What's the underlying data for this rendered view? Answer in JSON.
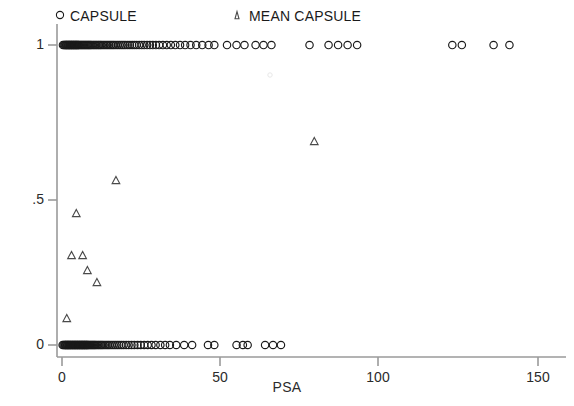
{
  "chart_data": {
    "type": "scatter",
    "title": "",
    "xlabel": "PSA",
    "ylabel": "",
    "xlim": [
      0,
      150
    ],
    "ylim": [
      0,
      1
    ],
    "xticks": [
      0,
      50,
      100,
      150
    ],
    "xtick_labels": [
      "0",
      "50",
      "100",
      "150"
    ],
    "yticks": [
      0,
      0.5,
      1
    ],
    "ytick_labels": [
      "0",
      ".5",
      "1"
    ],
    "grid": false,
    "legend_position": "top",
    "series": [
      {
        "name": "CAPSULE",
        "marker": "circle",
        "color": "#1a1a1a",
        "points": [
          [
            0.3,
            1
          ],
          [
            0.6,
            1
          ],
          [
            0.9,
            1
          ],
          [
            1.1,
            1
          ],
          [
            1.3,
            1
          ],
          [
            1.5,
            1
          ],
          [
            1.7,
            1
          ],
          [
            1.9,
            1
          ],
          [
            2.1,
            1
          ],
          [
            2.3,
            1
          ],
          [
            2.5,
            1
          ],
          [
            2.7,
            1
          ],
          [
            2.9,
            1
          ],
          [
            3.1,
            1
          ],
          [
            3.3,
            1
          ],
          [
            3.5,
            1
          ],
          [
            3.7,
            1
          ],
          [
            3.9,
            1
          ],
          [
            4.1,
            1
          ],
          [
            4.3,
            1
          ],
          [
            4.5,
            1
          ],
          [
            4.7,
            1
          ],
          [
            4.9,
            1
          ],
          [
            5.1,
            1
          ],
          [
            5.3,
            1
          ],
          [
            5.6,
            1
          ],
          [
            5.9,
            1
          ],
          [
            6.2,
            1
          ],
          [
            6.5,
            1
          ],
          [
            6.8,
            1
          ],
          [
            7.1,
            1
          ],
          [
            7.4,
            1
          ],
          [
            7.7,
            1
          ],
          [
            8.0,
            1
          ],
          [
            8.3,
            1
          ],
          [
            8.6,
            1
          ],
          [
            8.9,
            1
          ],
          [
            9.2,
            1
          ],
          [
            9.6,
            1
          ],
          [
            10.0,
            1
          ],
          [
            10.4,
            1
          ],
          [
            10.8,
            1
          ],
          [
            11.2,
            1
          ],
          [
            11.6,
            1
          ],
          [
            12.0,
            1
          ],
          [
            12.4,
            1
          ],
          [
            12.9,
            1
          ],
          [
            13.4,
            1
          ],
          [
            13.9,
            1
          ],
          [
            14.4,
            1
          ],
          [
            14.9,
            1
          ],
          [
            15.4,
            1
          ],
          [
            15.9,
            1
          ],
          [
            16.4,
            1
          ],
          [
            17.0,
            1
          ],
          [
            17.6,
            1
          ],
          [
            18.2,
            1
          ],
          [
            18.8,
            1
          ],
          [
            19.4,
            1
          ],
          [
            20.0,
            1
          ],
          [
            20.7,
            1
          ],
          [
            21.4,
            1
          ],
          [
            22.1,
            1
          ],
          [
            22.8,
            1
          ],
          [
            23.5,
            1
          ],
          [
            24.3,
            1
          ],
          [
            25.1,
            1
          ],
          [
            25.9,
            1
          ],
          [
            26.8,
            1
          ],
          [
            27.7,
            1
          ],
          [
            28.6,
            1
          ],
          [
            29.6,
            1
          ],
          [
            30.6,
            1
          ],
          [
            31.8,
            1
          ],
          [
            33.0,
            1
          ],
          [
            34.3,
            1
          ],
          [
            35.7,
            1
          ],
          [
            37.2,
            1
          ],
          [
            38.8,
            1
          ],
          [
            40.5,
            1
          ],
          [
            42.3,
            1
          ],
          [
            44.2,
            1
          ],
          [
            46.2,
            1
          ],
          [
            48.0,
            1
          ],
          [
            52.0,
            1
          ],
          [
            55.0,
            1
          ],
          [
            57.5,
            1
          ],
          [
            61.0,
            1
          ],
          [
            63.5,
            1
          ],
          [
            66.0,
            1
          ],
          [
            78.0,
            1
          ],
          [
            84.0,
            1
          ],
          [
            87.0,
            1
          ],
          [
            90.0,
            1
          ],
          [
            93.0,
            1
          ],
          [
            123.0,
            1
          ],
          [
            126.0,
            1
          ],
          [
            136.0,
            1
          ],
          [
            141.0,
            1
          ],
          [
            0.2,
            0
          ],
          [
            0.5,
            0
          ],
          [
            0.8,
            0
          ],
          [
            1.0,
            0
          ],
          [
            1.2,
            0
          ],
          [
            1.4,
            0
          ],
          [
            1.6,
            0
          ],
          [
            1.8,
            0
          ],
          [
            2.0,
            0
          ],
          [
            2.2,
            0
          ],
          [
            2.4,
            0
          ],
          [
            2.6,
            0
          ],
          [
            2.8,
            0
          ],
          [
            3.0,
            0
          ],
          [
            3.2,
            0
          ],
          [
            3.4,
            0
          ],
          [
            3.6,
            0
          ],
          [
            3.8,
            0
          ],
          [
            4.0,
            0
          ],
          [
            4.2,
            0
          ],
          [
            4.4,
            0
          ],
          [
            4.6,
            0
          ],
          [
            4.8,
            0
          ],
          [
            5.0,
            0
          ],
          [
            5.2,
            0
          ],
          [
            5.4,
            0
          ],
          [
            5.6,
            0
          ],
          [
            5.8,
            0
          ],
          [
            6.0,
            0
          ],
          [
            6.2,
            0
          ],
          [
            6.4,
            0
          ],
          [
            6.6,
            0
          ],
          [
            6.8,
            0
          ],
          [
            7.0,
            0
          ],
          [
            7.2,
            0
          ],
          [
            7.4,
            0
          ],
          [
            7.6,
            0
          ],
          [
            7.8,
            0
          ],
          [
            8.0,
            0
          ],
          [
            8.2,
            0
          ],
          [
            8.5,
            0
          ],
          [
            8.8,
            0
          ],
          [
            9.1,
            0
          ],
          [
            9.4,
            0
          ],
          [
            9.7,
            0
          ],
          [
            10.0,
            0
          ],
          [
            10.3,
            0
          ],
          [
            10.6,
            0
          ],
          [
            11.0,
            0
          ],
          [
            11.4,
            0
          ],
          [
            11.8,
            0
          ],
          [
            12.2,
            0
          ],
          [
            12.6,
            0
          ],
          [
            13.0,
            0
          ],
          [
            13.5,
            0
          ],
          [
            14.0,
            0
          ],
          [
            14.5,
            0
          ],
          [
            15.0,
            0
          ],
          [
            15.6,
            0
          ],
          [
            16.2,
            0
          ],
          [
            16.8,
            0
          ],
          [
            17.4,
            0
          ],
          [
            18.0,
            0
          ],
          [
            18.7,
            0
          ],
          [
            19.4,
            0
          ],
          [
            20.2,
            0
          ],
          [
            21.0,
            0
          ],
          [
            21.9,
            0
          ],
          [
            22.8,
            0
          ],
          [
            23.8,
            0
          ],
          [
            24.8,
            0
          ],
          [
            25.9,
            0
          ],
          [
            27.0,
            0
          ],
          [
            28.2,
            0
          ],
          [
            29.5,
            0
          ],
          [
            31.0,
            0
          ],
          [
            32.5,
            0
          ],
          [
            34.0,
            0
          ],
          [
            36.0,
            0
          ],
          [
            38.5,
            0
          ],
          [
            41.0,
            0
          ],
          [
            46.0,
            0
          ],
          [
            48.0,
            0
          ],
          [
            55.0,
            0
          ],
          [
            57.0,
            0
          ],
          [
            58.5,
            0
          ],
          [
            64.0,
            0
          ],
          [
            66.5,
            0
          ],
          [
            69.0,
            0
          ]
        ]
      },
      {
        "name": "MEAN CAPSULE",
        "marker": "triangle",
        "color": "#4a4a4a",
        "points": [
          [
            1.5,
            0.09
          ],
          [
            3.0,
            0.3
          ],
          [
            4.5,
            0.44
          ],
          [
            6.5,
            0.3
          ],
          [
            8.0,
            0.25
          ],
          [
            11.0,
            0.21
          ],
          [
            17.0,
            0.55
          ],
          [
            79.5,
            0.68
          ]
        ]
      }
    ]
  },
  "legend": {
    "entries": [
      {
        "label": "CAPSULE",
        "marker": "circle"
      },
      {
        "label": "MEAN CAPSULE",
        "marker": "triangle"
      }
    ]
  },
  "axes": {
    "x_title": "PSA",
    "x_labels": [
      "0",
      "50",
      "100",
      "150"
    ],
    "y_labels": [
      "1",
      ".5",
      "0"
    ]
  }
}
